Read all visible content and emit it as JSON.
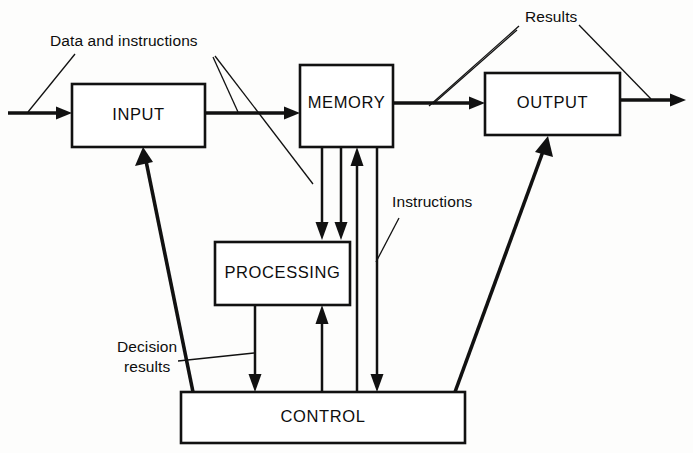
{
  "diagram": {
    "canvas": {
      "width": 693,
      "height": 453,
      "background": "#fdfdfc"
    },
    "ink_color": "#111111",
    "boxes": [
      {
        "id": "input",
        "label": "INPUT",
        "x": 72,
        "y": 84,
        "w": 133,
        "h": 63
      },
      {
        "id": "memory",
        "label": "MEMORY",
        "x": 300,
        "y": 65,
        "w": 93,
        "h": 82
      },
      {
        "id": "output",
        "label": "OUTPUT",
        "x": 485,
        "y": 73,
        "w": 135,
        "h": 62
      },
      {
        "id": "processing",
        "label": "PROCESSING",
        "x": 215,
        "y": 242,
        "w": 135,
        "h": 63
      },
      {
        "id": "control",
        "label": "CONTROL",
        "x": 181,
        "y": 392,
        "w": 284,
        "h": 51
      }
    ],
    "annotations": [
      {
        "id": "data-and-instructions",
        "text": "Data and instructions",
        "x": 50,
        "y": 46
      },
      {
        "id": "results",
        "text": "Results",
        "x": 525,
        "y": 22
      },
      {
        "id": "instructions",
        "text": "Instructions",
        "x": 392,
        "y": 207
      },
      {
        "id": "decision-results-1",
        "text": "Decision",
        "x": 117,
        "y": 352
      },
      {
        "id": "decision-results-2",
        "text": "results",
        "x": 124,
        "y": 372
      }
    ],
    "flows": [
      {
        "id": "external-to-input",
        "from": "external",
        "to": "input",
        "kind": "thick-arrow"
      },
      {
        "id": "input-to-memory",
        "from": "input",
        "to": "memory",
        "kind": "thick-arrow"
      },
      {
        "id": "memory-to-output",
        "from": "memory",
        "to": "output",
        "kind": "thick-arrow"
      },
      {
        "id": "output-to-external",
        "from": "output",
        "to": "external",
        "kind": "thick-arrow"
      },
      {
        "id": "control-to-input",
        "from": "control",
        "to": "input",
        "kind": "thick-arrow"
      },
      {
        "id": "control-to-output",
        "from": "control",
        "to": "output",
        "kind": "thick-arrow"
      },
      {
        "id": "memory-to-processing-a",
        "from": "memory",
        "to": "processing",
        "kind": "arrow-down"
      },
      {
        "id": "memory-to-processing-b",
        "from": "memory",
        "to": "processing",
        "kind": "arrow-down"
      },
      {
        "id": "control-to-memory",
        "from": "control",
        "to": "memory",
        "kind": "arrow-up"
      },
      {
        "id": "memory-to-control",
        "from": "memory",
        "to": "control",
        "kind": "arrow-down"
      },
      {
        "id": "processing-to-control",
        "from": "processing",
        "to": "control",
        "kind": "arrow-down"
      },
      {
        "id": "control-to-processing",
        "from": "control",
        "to": "processing",
        "kind": "arrow-up"
      }
    ]
  }
}
